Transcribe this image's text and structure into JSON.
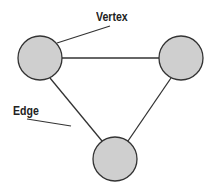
{
  "diagram": {
    "type": "graph",
    "labels": {
      "vertex": "Vertex",
      "edge": "Edge"
    },
    "colors": {
      "vertex_fill": "#cfcfcf",
      "stroke": "#333333",
      "text": "#222222"
    },
    "vertices": [
      {
        "id": "v1",
        "cx": 40,
        "cy": 58,
        "r": 22
      },
      {
        "id": "v2",
        "cx": 181,
        "cy": 58,
        "r": 22
      },
      {
        "id": "v3",
        "cx": 115,
        "cy": 159,
        "r": 22
      }
    ],
    "edges": [
      {
        "from": "v1",
        "to": "v2"
      },
      {
        "from": "v1",
        "to": "v3"
      },
      {
        "from": "v2",
        "to": "v3"
      }
    ]
  }
}
